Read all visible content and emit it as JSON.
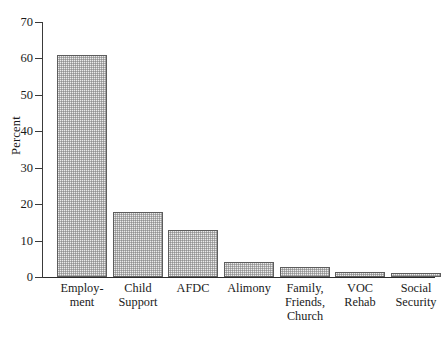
{
  "chart_data": {
    "type": "bar",
    "title": "",
    "subtitle": "",
    "xlabel": "",
    "ylabel": "Percent",
    "ylim": [
      0,
      70
    ],
    "yticks": [
      0,
      10,
      20,
      30,
      40,
      50,
      60,
      70
    ],
    "ytick_labels": [
      "0",
      "10",
      "20",
      "30",
      "40",
      "50",
      "60",
      "70"
    ],
    "grid": false,
    "legend": false,
    "legend_position": "none",
    "categories": [
      "Employ-\nment",
      "Child\nSupport",
      "AFDC",
      "Alimony",
      "Family,\nFriends,\nChurch",
      "VOC\nRehab",
      "Social\nSecurity"
    ],
    "category_names_plain": [
      "Employment",
      "Child Support",
      "AFDC",
      "Alimony",
      "Family, Friends, Church",
      "VOC Rehab",
      "Social Security"
    ],
    "values": [
      61,
      17.8,
      12.9,
      4.2,
      2.7,
      1.3,
      1.2
    ],
    "bar_fill_color": "#ebebeb",
    "bar_edge_color": "#5d5d5d",
    "bar_fill_pattern": "fine-checkerboard-stipple",
    "axis_color": "#2b2b2b",
    "text_color": "#1a1a1a",
    "background_color": "#ffffff"
  },
  "layout": {
    "bar_pixel_geometry": [
      {
        "left": 15,
        "width": 50
      },
      {
        "left": 71,
        "width": 50
      },
      {
        "left": 126,
        "width": 50
      },
      {
        "left": 182,
        "width": 50
      },
      {
        "left": 238,
        "width": 50
      },
      {
        "left": 293,
        "width": 50
      },
      {
        "left": 349,
        "width": 50
      }
    ],
    "label_pixel_geometry": [
      {
        "left": 8,
        "width": 64
      },
      {
        "left": 64,
        "width": 64
      },
      {
        "left": 119,
        "width": 64
      },
      {
        "left": 175,
        "width": 64
      },
      {
        "left": 231,
        "width": 64
      },
      {
        "left": 286,
        "width": 64
      },
      {
        "left": 342,
        "width": 64
      }
    ]
  }
}
